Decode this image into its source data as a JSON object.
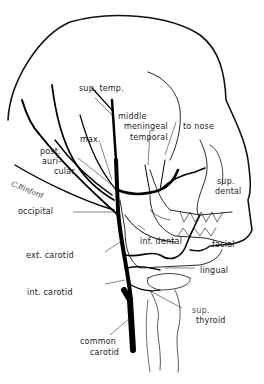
{
  "figure": {
    "signature": "C.Binford"
  },
  "labels": {
    "sup_temp": "sup. temp.",
    "middle": "middle",
    "meningeal": "meningeal",
    "temporal": "temporal",
    "to_nose": "to nose",
    "max": "max.",
    "post": "post.",
    "auri": "auri-",
    "cular": "cular",
    "sup": "sup.",
    "dental": "dental",
    "occipital": "occipital",
    "inf_dental": "inf. dental",
    "facial": "facial",
    "ext_carotid": "ext. carotid",
    "lingual": "lingual",
    "int_carotid": "int. carotid",
    "sup2": "sup.",
    "thyroid": "thyroid",
    "common": "common",
    "carotid": "carotid"
  }
}
